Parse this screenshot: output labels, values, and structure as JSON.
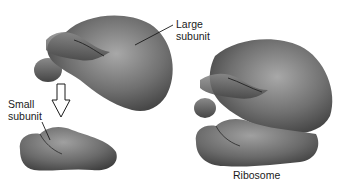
{
  "diagram": {
    "labels": {
      "large_subunit": [
        "Large",
        "subunit"
      ],
      "small_subunit": [
        "Small",
        "subunit"
      ],
      "ribosome": "Ribosome"
    },
    "elements": [
      {
        "name": "large-subunit",
        "description": "Separated large subunit, top left"
      },
      {
        "name": "small-subunit",
        "description": "Separated small subunit, bottom left"
      },
      {
        "name": "assembly-arrow",
        "description": "Hollow down arrow indicating small subunit joins large subunit"
      },
      {
        "name": "ribosome",
        "description": "Assembled ribosome, right"
      }
    ],
    "colors": {
      "shape_dark": "#3c3c3c",
      "shape_mid": "#6e6e6e",
      "shape_light": "#a8a8a8",
      "text": "#1a1a1a",
      "background": "#ffffff"
    }
  }
}
